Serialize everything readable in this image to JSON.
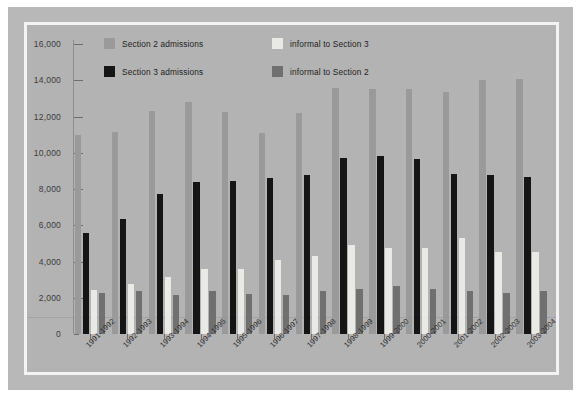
{
  "chart_data": {
    "type": "bar",
    "title": "",
    "subtitle": "",
    "xlabel": "",
    "ylabel": "",
    "ylim": [
      0,
      16000
    ],
    "yticks": [
      0,
      2000,
      4000,
      6000,
      8000,
      10000,
      12000,
      14000,
      16000
    ],
    "ytick_labels": [
      "0",
      "2,000",
      "4,000",
      "6,000",
      "8,000",
      "10,000",
      "12,000",
      "14,000",
      "16,000"
    ],
    "grid": false,
    "legend_position": "top-center",
    "categories": [
      "1991-1992",
      "1992-1993",
      "1993-1994",
      "1994-1995",
      "1995-1996",
      "1996-1997",
      "1997-1998",
      "1998-1999",
      "1999-2000",
      "2000-2001",
      "2001-2002",
      "2002-2003",
      "2003-2004"
    ],
    "series": [
      {
        "name": "Section 2 admissions",
        "color": "#9a9a9a",
        "values": [
          11000,
          11150,
          12300,
          12800,
          12250,
          11100,
          12200,
          13600,
          13500,
          13500,
          13350,
          14000,
          14050
        ]
      },
      {
        "name": "Section 3 admissions",
        "color": "#151515",
        "values": [
          5550,
          6350,
          7700,
          8400,
          8450,
          8600,
          8750,
          9700,
          9800,
          9650,
          8850,
          8800,
          8650
        ]
      },
      {
        "name": "informal to Section 3",
        "color": "#e9e9e6",
        "values": [
          2450,
          2750,
          3150,
          3600,
          3600,
          4100,
          4300,
          4900,
          4750,
          4750,
          5300,
          4550,
          4500
        ]
      },
      {
        "name": "informal to Section 2",
        "color": "#707070",
        "values": [
          2250,
          2400,
          2150,
          2350,
          2200,
          2150,
          2400,
          2500,
          2650,
          2500,
          2400,
          2250,
          2350
        ]
      }
    ]
  },
  "legend": {
    "items": [
      {
        "label": "Section 2 admissions",
        "color": "#9a9a9a"
      },
      {
        "label": "informal to Section 3",
        "color": "#e9e9e6"
      },
      {
        "label": "Section 3 admissions",
        "color": "#151515"
      },
      {
        "label": "informal to Section 2",
        "color": "#707070"
      }
    ]
  },
  "colors": {
    "page_background": "#ffffff",
    "mat": "#b8b8b8",
    "plot_background": "#b3b3b3",
    "frame": "#f3f3f3",
    "axis": "#6d6d6d",
    "text": "#2e2e2e"
  }
}
